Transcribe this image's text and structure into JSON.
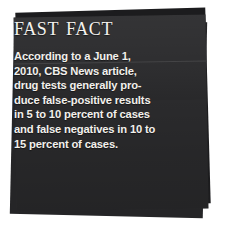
{
  "callout": {
    "kind": "fast-fact-sidebar",
    "title": "Fast Fact",
    "body_lines": [
      "According to a June 1,",
      "2010, CBS News article,",
      "drug tests generally pro-",
      "duce false-positive results",
      "in 5 to 10 percent of cases",
      "and false negatives in 10 to",
      "15 percent of cases."
    ],
    "body_text": "According to a June 1, 2010, CBS News article, drug tests generally produce false-positive results in 5 to 10 percent of cases and false negatives in 10 to 15 percent of cases.",
    "colors": {
      "paper_front": "#2b2b2d",
      "paper_mid": "#252527",
      "paper_back": "#1c1c1e",
      "text": "#f2f0ec",
      "title_text": "#f4f2ee",
      "page_background": "#ffffff"
    }
  }
}
